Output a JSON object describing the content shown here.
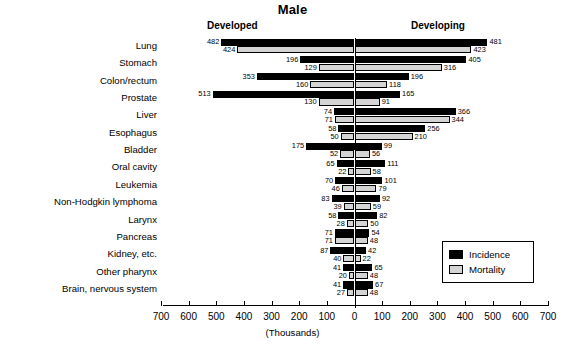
{
  "chart_data": {
    "type": "bar",
    "orientation": "horizontal",
    "style": "bidirectional-population-pyramid",
    "title": "Male",
    "xlabel": "(Thousands)",
    "ylabel": "",
    "panel_labels": {
      "left": "Developed",
      "right": "Developing"
    },
    "legend": {
      "position": "bottom-right",
      "entries": [
        {
          "name": "Incidence",
          "color": "#000000"
        },
        {
          "name": "Mortality",
          "color": "#d4d4d4"
        }
      ]
    },
    "axis": {
      "ticks": [
        700,
        600,
        500,
        400,
        300,
        200,
        100,
        0,
        100,
        200,
        300,
        400,
        500,
        600,
        700
      ],
      "tick_labels": [
        "700",
        "600",
        "500",
        "400",
        "300",
        "200",
        "100",
        "0",
        "100",
        "200",
        "300",
        "400",
        "500",
        "600",
        "700"
      ],
      "signed_values": [
        -700,
        -600,
        -500,
        -400,
        -300,
        -200,
        -100,
        0,
        100,
        200,
        300,
        400,
        500,
        600,
        700
      ],
      "xlim": [
        -700,
        700
      ],
      "grid": false,
      "units": "Thousands"
    },
    "categories": [
      "Lung",
      "Stomach",
      "Colon/rectum",
      "Prostate",
      "Liver",
      "Esophagus",
      "Bladder",
      "Oral cavity",
      "Leukemia",
      "Non-Hodgkin lymphoma",
      "Larynx",
      "Pancreas",
      "Kidney, etc.",
      "Other pharynx",
      "Brain, nervous system"
    ],
    "series": [
      {
        "name": "Developed Incidence",
        "side": "left",
        "measure": "Incidence",
        "color": "#000000",
        "values": [
          482,
          196,
          353,
          513,
          74,
          58,
          175,
          65,
          70,
          83,
          58,
          71,
          87,
          41,
          41
        ]
      },
      {
        "name": "Developed Mortality",
        "side": "left",
        "measure": "Mortality",
        "color": "#d4d4d4",
        "values": [
          424,
          129,
          160,
          130,
          71,
          50,
          52,
          22,
          46,
          39,
          28,
          71,
          40,
          20,
          27
        ]
      },
      {
        "name": "Developing Incidence",
        "side": "right",
        "measure": "Incidence",
        "color": "#000000",
        "values": [
          481,
          405,
          196,
          165,
          366,
          256,
          99,
          111,
          101,
          92,
          82,
          54,
          42,
          65,
          67
        ]
      },
      {
        "name": "Developing Mortality",
        "side": "right",
        "measure": "Mortality",
        "color": "#d4d4d4",
        "values": [
          423,
          316,
          118,
          91,
          344,
          210,
          56,
          58,
          79,
          59,
          50,
          48,
          22,
          48,
          48
        ]
      }
    ],
    "rows": [
      {
        "label": "Lung",
        "dev_inc": 482,
        "dev_mor": 424,
        "dng_inc": 481,
        "dng_mor": 423
      },
      {
        "label": "Stomach",
        "dev_inc": 196,
        "dev_mor": 129,
        "dng_inc": 405,
        "dng_mor": 316
      },
      {
        "label": "Colon/rectum",
        "dev_inc": 353,
        "dev_mor": 160,
        "dng_inc": 196,
        "dng_mor": 118
      },
      {
        "label": "Prostate",
        "dev_inc": 513,
        "dev_mor": 130,
        "dng_inc": 165,
        "dng_mor": 91
      },
      {
        "label": "Liver",
        "dev_inc": 74,
        "dev_mor": 71,
        "dng_inc": 366,
        "dng_mor": 344
      },
      {
        "label": "Esophagus",
        "dev_inc": 58,
        "dev_mor": 50,
        "dng_inc": 256,
        "dng_mor": 210
      },
      {
        "label": "Bladder",
        "dev_inc": 175,
        "dev_mor": 52,
        "dng_inc": 99,
        "dng_mor": 56
      },
      {
        "label": "Oral cavity",
        "dev_inc": 65,
        "dev_mor": 22,
        "dng_inc": 111,
        "dng_mor": 58
      },
      {
        "label": "Leukemia",
        "dev_inc": 70,
        "dev_mor": 46,
        "dng_inc": 101,
        "dng_mor": 79
      },
      {
        "label": "Non-Hodgkin lymphoma",
        "dev_inc": 83,
        "dev_mor": 39,
        "dng_inc": 92,
        "dng_mor": 59
      },
      {
        "label": "Larynx",
        "dev_inc": 58,
        "dev_mor": 28,
        "dng_inc": 82,
        "dng_mor": 50
      },
      {
        "label": "Pancreas",
        "dev_inc": 71,
        "dev_mor": 71,
        "dng_inc": 54,
        "dng_mor": 48
      },
      {
        "label": "Kidney, etc.",
        "dev_inc": 87,
        "dev_mor": 40,
        "dng_inc": 42,
        "dng_mor": 22
      },
      {
        "label": "Other pharynx",
        "dev_inc": 41,
        "dev_mor": 20,
        "dng_inc": 65,
        "dng_mor": 48
      },
      {
        "label": "Brain, nervous system",
        "dev_inc": 41,
        "dev_mor": 27,
        "dng_inc": 67,
        "dng_mor": 48
      }
    ]
  }
}
